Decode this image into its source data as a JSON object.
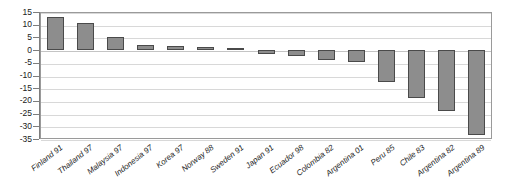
{
  "chart_data": {
    "type": "bar",
    "title": "",
    "subtitle": "",
    "xlabel": "",
    "ylabel": "",
    "ylim": [
      -35,
      15
    ],
    "ytick_step": 5,
    "grid": true,
    "legend": false,
    "orientation": "vertical",
    "bar_color": "#8d8d8d",
    "bar_border_color": "#4a4a4a",
    "gridline_color": "#d8d8d8",
    "frame_color": "#9a9a9a",
    "yticks": [
      15,
      10,
      5,
      0,
      -5,
      -10,
      -15,
      -20,
      -25,
      -30,
      -35
    ],
    "ytick_labels": [
      "15",
      "10",
      "5",
      "0",
      "-5",
      "-10",
      "-15",
      "-20",
      "-25",
      "-30",
      "-35"
    ],
    "categories": [
      "Finland 91",
      "Thailand 97",
      "Malaysia 97",
      "Indonesia 97",
      "Korea 97",
      "Norway 88",
      "Sweden 91",
      "Japan 91",
      "Ecuador 98",
      "Colombia 82",
      "Argentina 01",
      "Peru 85",
      "Chile 83",
      "Argentina 82",
      "Argentina 89"
    ],
    "values": [
      13,
      10.5,
      5.2,
      2.2,
      1.5,
      1.1,
      0.9,
      -1.5,
      -2.5,
      -4,
      -4.5,
      -12.5,
      -19,
      -24,
      -33.5
    ]
  }
}
